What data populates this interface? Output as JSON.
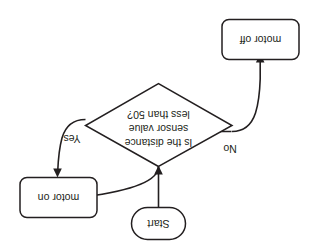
{
  "diagram": {
    "orientation_degrees": 180,
    "colors": {
      "background": "#ffffff",
      "stroke": "#231f20",
      "text": "#231f20",
      "fill": "#ffffff"
    },
    "nodes": [
      {
        "id": "start",
        "shape": "stadium",
        "label": "Start"
      },
      {
        "id": "decision",
        "shape": "diamond",
        "label_lines": [
          "Is the distance",
          "sensor value",
          "less than 50?"
        ]
      },
      {
        "id": "motor-on",
        "shape": "rounded-rectangle",
        "label": "motor on"
      },
      {
        "id": "motor-off",
        "shape": "rounded-rectangle",
        "label": "motor off"
      }
    ],
    "edges": [
      {
        "id": "start-to-decision",
        "from": "start",
        "to": "decision",
        "label": ""
      },
      {
        "id": "decision-to-motor-on",
        "from": "decision",
        "to": "motor-on",
        "label": "Yes"
      },
      {
        "id": "decision-to-motor-off",
        "from": "decision",
        "to": "motor-off",
        "label": "No"
      },
      {
        "id": "motor-off-to-decision",
        "from": "motor-off",
        "to": "decision",
        "label": ""
      },
      {
        "id": "motor-on-to-decision",
        "from": "motor-on",
        "to": "decision",
        "label": ""
      }
    ]
  }
}
